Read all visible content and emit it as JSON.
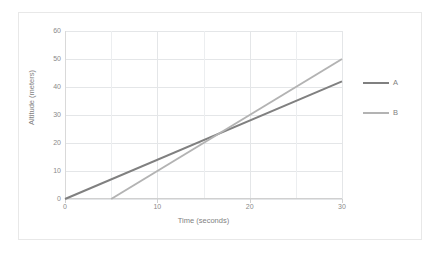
{
  "chart_data": {
    "type": "line",
    "title": "",
    "xlabel": "Time (seconds)",
    "ylabel": "Altitude (meters)",
    "xlim": [
      0,
      30
    ],
    "ylim": [
      0,
      60
    ],
    "x_ticks": [
      0,
      10,
      20,
      30
    ],
    "x_tick_labels": [
      "0",
      "10",
      "20",
      "30"
    ],
    "y_ticks": [
      0,
      10,
      20,
      30,
      40,
      50,
      60
    ],
    "y_tick_labels": [
      "0",
      "10",
      "20",
      "30",
      "40",
      "50",
      "60"
    ],
    "x_minor_gridlines": [
      5,
      15,
      25
    ],
    "grid": true,
    "legend_position": "right",
    "series": [
      {
        "name": "A",
        "color": "#808080",
        "points": [
          [
            0,
            0
          ],
          [
            30,
            42
          ]
        ],
        "slope": 1.4,
        "intercept": 0
      },
      {
        "name": "B",
        "color": "#b3b3b3",
        "points": [
          [
            5,
            0
          ],
          [
            30,
            50
          ]
        ],
        "slope": 2.0,
        "intercept": -10
      }
    ],
    "intersection": [
      16.0,
      22.4
    ]
  },
  "legend": {
    "items": [
      {
        "label": "A",
        "color": "#808080"
      },
      {
        "label": "B",
        "color": "#b3b3b3"
      }
    ]
  },
  "colors": {
    "series_a": "#808080",
    "series_b": "#b3b3b3",
    "grid": "#e4e6e8",
    "grid_minor": "#eceef0",
    "axis": "#d0d0d0",
    "text": "#7f7f7f",
    "border": "#e8e8e8",
    "background": "#ffffff"
  }
}
